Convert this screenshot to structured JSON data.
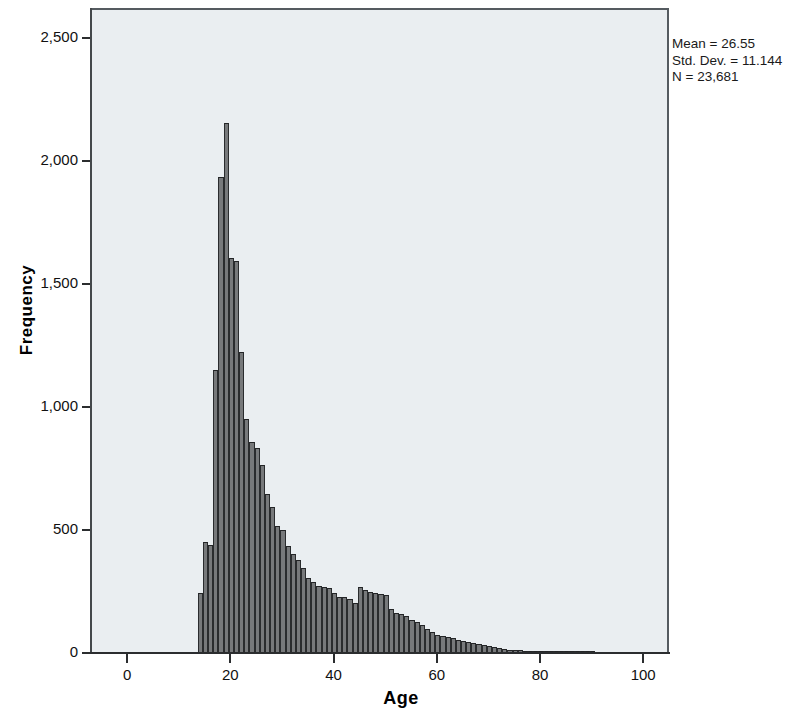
{
  "chart_data": {
    "type": "bar",
    "title": "",
    "xlabel": "Age",
    "ylabel": "Frequency",
    "xlim": [
      -7,
      105
    ],
    "ylim": [
      0,
      2620
    ],
    "xticks": [
      0,
      20,
      40,
      60,
      80,
      100
    ],
    "xtick_labels": [
      "0",
      "20",
      "40",
      "60",
      "80",
      "100"
    ],
    "yticks": [
      0,
      500,
      1000,
      1500,
      2000,
      2500
    ],
    "ytick_labels": [
      "0",
      "500",
      "1,000",
      "1,500",
      "2,000",
      "2,500"
    ],
    "grid": false,
    "legend": null,
    "bin_width": 1,
    "bar_color": "#77797b",
    "bar_edge_color": "#2a2c2e",
    "plot_background": "#eaeef1",
    "x": [
      14,
      15,
      16,
      17,
      18,
      19,
      20,
      21,
      22,
      23,
      24,
      25,
      26,
      27,
      28,
      29,
      30,
      31,
      32,
      33,
      34,
      35,
      36,
      37,
      38,
      39,
      40,
      41,
      42,
      43,
      44,
      45,
      46,
      47,
      48,
      49,
      50,
      51,
      52,
      53,
      54,
      55,
      56,
      57,
      58,
      59,
      60,
      61,
      62,
      63,
      64,
      65,
      66,
      67,
      68,
      69,
      70,
      71,
      72,
      73,
      74,
      75,
      76,
      77,
      78,
      79,
      80,
      81,
      82,
      83,
      84,
      85,
      86,
      87,
      88,
      89,
      90
    ],
    "values": [
      240,
      445,
      435,
      1145,
      1930,
      2150,
      1600,
      1590,
      1220,
      945,
      855,
      830,
      760,
      640,
      590,
      510,
      495,
      430,
      400,
      375,
      340,
      300,
      285,
      270,
      265,
      260,
      240,
      225,
      225,
      215,
      200,
      265,
      250,
      245,
      240,
      235,
      230,
      175,
      160,
      155,
      145,
      130,
      120,
      110,
      95,
      80,
      70,
      65,
      60,
      55,
      48,
      44,
      40,
      36,
      32,
      28,
      24,
      20,
      16,
      12,
      10,
      8,
      7,
      6,
      5,
      4,
      4,
      3,
      3,
      2,
      2,
      2,
      2,
      1,
      1,
      1,
      1
    ]
  },
  "annotations": {
    "mean_label": "Mean = 26.55",
    "std_dev_label": "Std. Dev. = 11.144",
    "n_label": "N = 23,681"
  }
}
